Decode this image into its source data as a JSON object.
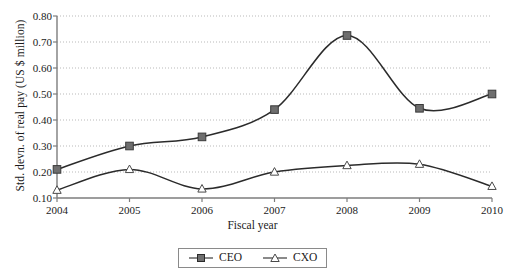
{
  "chart_data": {
    "type": "line",
    "title": "",
    "subtitle": "",
    "xlabel": "Fiscal year",
    "ylabel": "Std. devn. of real pay (US $ million)",
    "x": [
      2004,
      2005,
      2006,
      2007,
      2008,
      2009,
      2010
    ],
    "categories": [
      "2004",
      "2005",
      "2006",
      "2007",
      "2008",
      "2009",
      "2010"
    ],
    "xtick_labels": [
      "2004",
      "2005",
      "2006",
      "2007",
      "2008",
      "2009",
      "2010"
    ],
    "ytick_labels": [
      "0.10",
      "0.20",
      "0.30",
      "0.40",
      "0.50",
      "0.60",
      "0.70",
      "0.80"
    ],
    "ytick_values": [
      0.1,
      0.2,
      0.3,
      0.4,
      0.5,
      0.6,
      0.7,
      0.8
    ],
    "xlim": [
      2004,
      2010
    ],
    "ylim": [
      0.1,
      0.8
    ],
    "grid": "horizontal-dotted",
    "legend_position": "bottom-center",
    "interpolation": "smooth",
    "series": [
      {
        "name": "CEO",
        "marker": "filled-square",
        "color": "#6e6e6e",
        "line_color": "#2b2b2b",
        "values": [
          0.21,
          0.3,
          0.335,
          0.44,
          0.725,
          0.445,
          0.5
        ]
      },
      {
        "name": "CXO",
        "marker": "open-triangle",
        "color": "#ffffff",
        "line_color": "#2b2b2b",
        "values": [
          0.13,
          0.21,
          0.135,
          0.2,
          0.225,
          0.23,
          0.145
        ]
      }
    ]
  },
  "legend": {
    "items": [
      {
        "label": "CEO"
      },
      {
        "label": "CXO"
      }
    ]
  },
  "axis": {
    "y_title": "Std. devn. of real pay (US $ million)",
    "x_title": "Fiscal year"
  }
}
